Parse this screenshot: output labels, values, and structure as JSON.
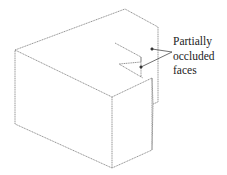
{
  "diagram": {
    "type": "isometric-block-with-notch",
    "annotation": {
      "lines": [
        "Partially",
        "occluded",
        "faces"
      ]
    },
    "colors": {
      "stroke": "#7a7a7a",
      "text": "#222222",
      "background": "#ffffff"
    }
  }
}
